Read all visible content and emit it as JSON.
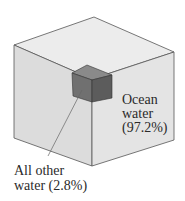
{
  "diagram": {
    "type": "proportion-cube",
    "segments": [
      {
        "name": "Ocean water",
        "percent": "97.2%",
        "label_line1": "Ocean",
        "label_line2": "water",
        "label_line3": "(97.2%)"
      },
      {
        "name": "All other water",
        "percent": "2.8%",
        "label_line1": "All other",
        "label_line2": "water (2.8%)"
      }
    ],
    "colors": {
      "big_top": "#ececec",
      "big_left": "#dcdcdc",
      "big_right": "#e4e4e4",
      "edge": "#555555",
      "small_top": "#8a8a8a",
      "small_left": "#707070",
      "small_right": "#5c5c5c"
    }
  }
}
